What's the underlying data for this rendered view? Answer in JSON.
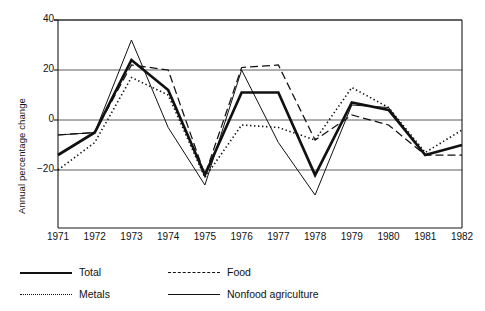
{
  "chart_data": {
    "type": "line",
    "title": "",
    "xlabel": "",
    "ylabel": "Annual percentage change",
    "x": [
      1971,
      1972,
      1973,
      1974,
      1975,
      1976,
      1977,
      1978,
      1979,
      1980,
      1981,
      1982
    ],
    "categories": [
      "1971",
      "1972",
      "1973",
      "1974",
      "1975",
      "1976",
      "1977",
      "1978",
      "1979",
      "1980",
      "1981",
      "1982"
    ],
    "ylim": [
      -32,
      40
    ],
    "yticks": [
      -20,
      0,
      20,
      40
    ],
    "ytick_labels": [
      "−20",
      "0",
      "20",
      "40"
    ],
    "grid": "horizontal",
    "legend_position": "below-left",
    "series": [
      {
        "name": "Total",
        "style": "solid-thick",
        "values": [
          -14,
          -5,
          24,
          12,
          -22,
          11,
          11,
          -22,
          7,
          4,
          -14,
          -10
        ]
      },
      {
        "name": "Food",
        "style": "dashed",
        "values": [
          -6,
          -5,
          22,
          20,
          -22,
          21,
          22,
          -8,
          2,
          -2,
          -14,
          -14
        ]
      },
      {
        "name": "Metals",
        "style": "dotted",
        "values": [
          -20,
          -9,
          17,
          10,
          -23,
          -2,
          -3,
          -8,
          13,
          5,
          -13,
          -4
        ]
      },
      {
        "name": "Nonfood agriculture",
        "style": "solid-thin",
        "values": [
          -6,
          -5,
          32,
          -3,
          -26,
          20,
          -9,
          -30,
          6,
          5,
          -14,
          -10
        ]
      }
    ]
  },
  "axes": {
    "y_title": "Annual percentage change",
    "y_tick_labels": [
      "40",
      "20",
      "0",
      "−20"
    ],
    "x_tick_labels": [
      "1971",
      "1972",
      "1973",
      "1974",
      "1975",
      "1976",
      "1977",
      "1978",
      "1979",
      "1980",
      "1981",
      "1982"
    ]
  },
  "legend": {
    "items": [
      {
        "label": "Total",
        "style": "solid-thick"
      },
      {
        "label": "Food",
        "style": "dashed"
      },
      {
        "label": "Metals",
        "style": "dotted"
      },
      {
        "label": "Nonfood agriculture",
        "style": "solid-thin"
      }
    ]
  }
}
